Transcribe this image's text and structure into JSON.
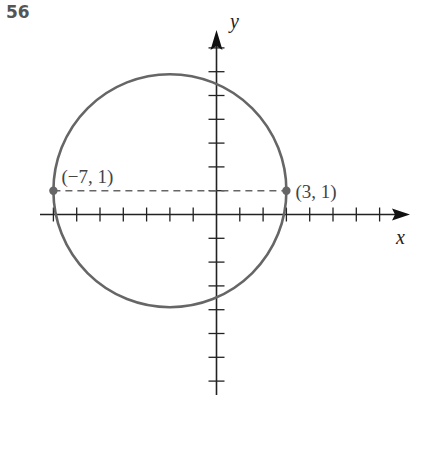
{
  "problem_number": "56",
  "axes": {
    "x_label": "x",
    "y_label": "y"
  },
  "points": [
    {
      "label": "(−7, 1)",
      "x": -7,
      "y": 1
    },
    {
      "label": "(3, 1)",
      "x": 3,
      "y": 1
    }
  ],
  "colors": {
    "curve": "#666666",
    "axis": "#222222",
    "point": "#666666",
    "dashed": "#666666",
    "label": "#444444"
  },
  "chart_data": {
    "type": "diagram",
    "title": "",
    "circle": {
      "center": [
        -2,
        1
      ],
      "radius": 5
    },
    "marked_points": [
      [
        -7,
        1
      ],
      [
        3,
        1
      ]
    ],
    "dashed_segment": {
      "from": [
        -7,
        1
      ],
      "to": [
        3,
        1
      ]
    },
    "xlabel": "x",
    "ylabel": "y",
    "x_ticks": [
      -7,
      -6,
      -5,
      -4,
      -3,
      -2,
      -1,
      1,
      2,
      3,
      4,
      5,
      6,
      7
    ],
    "y_ticks": [
      -7,
      -6,
      -5,
      -4,
      -3,
      -2,
      -1,
      1,
      2,
      3,
      4,
      5,
      6,
      7
    ],
    "xlim": [
      -7.5,
      8.2
    ],
    "ylim": [
      -7.7,
      7.8
    ],
    "grid": false
  }
}
